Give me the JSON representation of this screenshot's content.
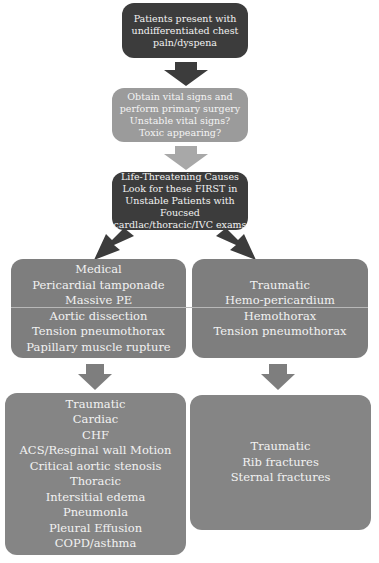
{
  "flowchart": {
    "step1": {
      "lines": [
        "Patients present with",
        "undifferentiated chest",
        "paln/dyspena"
      ]
    },
    "step2": {
      "lines": [
        "Obtain vital signs and",
        "perform primary surgery",
        "Unstable vital signs?",
        "Toxic appearing?"
      ]
    },
    "step3": {
      "lines": [
        "Life-Threatening Causes",
        "Look for these FIRST in",
        "Unstable Patients with",
        "Foucsed",
        "cardlac/thoracic/IVC exams"
      ]
    },
    "medical": {
      "lines": [
        "Medical",
        "Pericardial tamponade",
        "Massive PE",
        "Aortic dissection",
        "Tension pneumothorax",
        "Papillary muscle rupture"
      ]
    },
    "traumatic_life": {
      "lines": [
        "Traumatic",
        "Hemo-pericardium",
        "Hemothorax",
        "Tension pneumothorax"
      ]
    },
    "other_causes": {
      "lines": [
        "Traumatic",
        "Cardiac",
        "CHF",
        "ACS/Resginal wall Motion",
        "Critical aortic stenosis",
        "Thoracic",
        "Intersitial edema",
        "Pneumonla",
        "Pleural Effusion",
        "COPD/asthma"
      ]
    },
    "traumatic_other": {
      "lines": [
        "Traumatic",
        "Rib fractures",
        "Sternal fractures"
      ]
    }
  },
  "colors": {
    "dark_box": "#3c3c3c",
    "light_box": "#9b9b9b",
    "mid_box": "#7e7e7e",
    "arrow_dark": "#3c3c3c",
    "arrow_light": "#a8a8a8",
    "arrow_mid": "#7e7e7e"
  }
}
